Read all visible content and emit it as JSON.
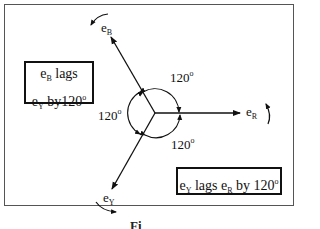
{
  "diagram": {
    "title_caption": "Fi",
    "phasors": [
      {
        "name": "e_R",
        "label_main": "e",
        "label_sub": "R",
        "angle_deg": 0
      },
      {
        "name": "e_B",
        "label_main": "e",
        "label_sub": "B",
        "angle_deg": 120
      },
      {
        "name": "e_Y",
        "label_main": "e",
        "label_sub": "Y",
        "angle_deg": 240
      }
    ],
    "angles": [
      {
        "value": "120",
        "unit": "o",
        "between": "e_B and e_R"
      },
      {
        "value": "120",
        "unit": "o",
        "between": "e_B and e_Y"
      },
      {
        "value": "120",
        "unit": "o",
        "between": "e_Y and e_R"
      }
    ],
    "rotation": "counter-clockwise",
    "note_left": {
      "line1_main": "e",
      "line1_sub": "B",
      "line1_rest": " lags",
      "line2_main": "e",
      "line2_sub": "Y",
      "line2_rest": " by120",
      "line2_sup": "o"
    },
    "note_right": {
      "p1": "e",
      "p1_sub": "Y",
      "p2": " lags e",
      "p2_sub": "R",
      "p3": " by 120",
      "p3_sup": "o"
    }
  }
}
